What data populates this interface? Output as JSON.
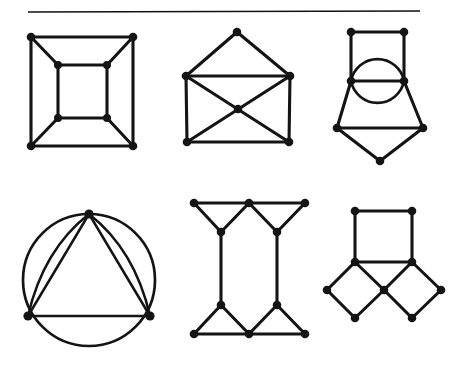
{
  "page": {
    "background_color": "#ffffff",
    "ink_color": "#141414",
    "width": 460,
    "height": 369
  },
  "rule": {
    "name": "horizontal-rule",
    "x1": 28,
    "y1": 12,
    "x2": 420,
    "y2": 11,
    "color": "#111111"
  },
  "figures": [
    {
      "id": "graph-1",
      "label": "nested-squares-cube-graph",
      "row": 1,
      "column": 1,
      "vertex_count": 8,
      "edge_count": 12,
      "vertices": [
        {
          "id": "o-tl",
          "x": 31,
          "y": 37
        },
        {
          "id": "o-tr",
          "x": 133,
          "y": 37
        },
        {
          "id": "o-br",
          "x": 133,
          "y": 146
        },
        {
          "id": "o-bl",
          "x": 31,
          "y": 146
        },
        {
          "id": "i-tl",
          "x": 58,
          "y": 65
        },
        {
          "id": "i-tr",
          "x": 107,
          "y": 65
        },
        {
          "id": "i-br",
          "x": 107,
          "y": 118
        },
        {
          "id": "i-bl",
          "x": 58,
          "y": 118
        }
      ],
      "edges": [
        [
          "o-tl",
          "o-tr"
        ],
        [
          "o-tr",
          "o-br"
        ],
        [
          "o-br",
          "o-bl"
        ],
        [
          "o-bl",
          "o-tl"
        ],
        [
          "i-tl",
          "i-tr"
        ],
        [
          "i-tr",
          "i-br"
        ],
        [
          "i-br",
          "i-bl"
        ],
        [
          "i-bl",
          "i-tl"
        ],
        [
          "o-tl",
          "i-tl"
        ],
        [
          "o-tr",
          "i-tr"
        ],
        [
          "o-br",
          "i-br"
        ],
        [
          "o-bl",
          "i-bl"
        ]
      ]
    },
    {
      "id": "graph-2",
      "label": "envelope-graph-with-crossing",
      "row": 1,
      "column": 2,
      "vertex_count": 6,
      "edge_count": 9,
      "vertices": [
        {
          "id": "apex",
          "x": 237,
          "y": 32
        },
        {
          "id": "left",
          "x": 186,
          "y": 76
        },
        {
          "id": "right",
          "x": 290,
          "y": 76
        },
        {
          "id": "center",
          "x": 238,
          "y": 109
        },
        {
          "id": "bl",
          "x": 187,
          "y": 142
        },
        {
          "id": "br",
          "x": 289,
          "y": 142
        }
      ],
      "edges": [
        [
          "apex",
          "left"
        ],
        [
          "apex",
          "right"
        ],
        [
          "left",
          "right"
        ],
        [
          "left",
          "bl"
        ],
        [
          "right",
          "br"
        ],
        [
          "bl",
          "br"
        ],
        [
          "left",
          "center"
        ],
        [
          "right",
          "center"
        ],
        [
          "center",
          "bl"
        ],
        [
          "center",
          "br"
        ]
      ]
    },
    {
      "id": "graph-3",
      "label": "square-circle-pentagon-graph",
      "row": 1,
      "column": 3,
      "vertex_count": 7,
      "edge_count": 10,
      "vertices": [
        {
          "id": "tl",
          "x": 351,
          "y": 32
        },
        {
          "id": "tr",
          "x": 404,
          "y": 32
        },
        {
          "id": "ml",
          "x": 351,
          "y": 81
        },
        {
          "id": "mr",
          "x": 404,
          "y": 81
        },
        {
          "id": "ll",
          "x": 337,
          "y": 128
        },
        {
          "id": "lr",
          "x": 423,
          "y": 128
        },
        {
          "id": "bottom",
          "x": 380,
          "y": 161
        }
      ],
      "edges": [
        [
          "tl",
          "tr"
        ],
        [
          "tl",
          "ml"
        ],
        [
          "tr",
          "mr"
        ],
        [
          "ml",
          "mr"
        ],
        [
          "ml",
          "ll"
        ],
        [
          "mr",
          "lr"
        ],
        [
          "ll",
          "lr"
        ],
        [
          "ll",
          "bottom"
        ],
        [
          "lr",
          "bottom"
        ]
      ],
      "arcs": [
        {
          "from": "ml",
          "to": "mr",
          "bulge": "up"
        },
        {
          "from": "ml",
          "to": "mr",
          "bulge": "down"
        }
      ]
    },
    {
      "id": "graph-4",
      "label": "circle-with-triangle-multi-edges",
      "row": 2,
      "column": 1,
      "vertex_count": 3,
      "edge_count": 6,
      "circle": {
        "cx": 89,
        "cy": 280,
        "r": 66
      },
      "vertices": [
        {
          "id": "top",
          "x": 89,
          "y": 214
        },
        {
          "id": "bl",
          "x": 28,
          "y": 316
        },
        {
          "id": "br",
          "x": 150,
          "y": 316
        }
      ],
      "edges": [
        [
          "top",
          "bl"
        ],
        [
          "top",
          "br"
        ],
        [
          "bl",
          "br"
        ]
      ],
      "arcs": [
        {
          "from": "top",
          "to": "bl",
          "bulge": "right"
        },
        {
          "from": "top",
          "to": "br",
          "bulge": "left"
        },
        {
          "from": "bl",
          "to": "br",
          "bulge": "down-outer"
        },
        {
          "from": "bl",
          "to": "top",
          "bulge": "left-outer"
        },
        {
          "from": "br",
          "to": "top",
          "bulge": "right-outer"
        }
      ]
    },
    {
      "id": "graph-5",
      "label": "h-shaped-double-triangle-graph",
      "row": 2,
      "column": 2,
      "vertex_count": 10,
      "edge_count": 14,
      "vertices": [
        {
          "id": "t-l",
          "x": 194,
          "y": 203
        },
        {
          "id": "t-m",
          "x": 249,
          "y": 203
        },
        {
          "id": "t-r",
          "x": 305,
          "y": 203
        },
        {
          "id": "ua-l",
          "x": 221,
          "y": 232
        },
        {
          "id": "ua-r",
          "x": 277,
          "y": 232
        },
        {
          "id": "la-l",
          "x": 221,
          "y": 305
        },
        {
          "id": "la-r",
          "x": 277,
          "y": 305
        },
        {
          "id": "b-l",
          "x": 194,
          "y": 334
        },
        {
          "id": "b-m",
          "x": 249,
          "y": 334
        },
        {
          "id": "b-r",
          "x": 305,
          "y": 334
        }
      ],
      "edges": [
        [
          "t-l",
          "t-m"
        ],
        [
          "t-m",
          "t-r"
        ],
        [
          "t-l",
          "ua-l"
        ],
        [
          "t-m",
          "ua-l"
        ],
        [
          "t-m",
          "ua-r"
        ],
        [
          "t-r",
          "ua-r"
        ],
        [
          "ua-l",
          "la-l"
        ],
        [
          "ua-r",
          "la-r"
        ],
        [
          "la-l",
          "b-l"
        ],
        [
          "la-l",
          "b-m"
        ],
        [
          "la-r",
          "b-m"
        ],
        [
          "la-r",
          "b-r"
        ],
        [
          "b-l",
          "b-m"
        ],
        [
          "b-m",
          "b-r"
        ]
      ]
    },
    {
      "id": "graph-6",
      "label": "square-with-two-diamonds-graph",
      "row": 2,
      "column": 3,
      "vertex_count": 8,
      "edge_count": 10,
      "vertices": [
        {
          "id": "sq-tl",
          "x": 355,
          "y": 211
        },
        {
          "id": "sq-tr",
          "x": 412,
          "y": 211
        },
        {
          "id": "sq-bl",
          "x": 355,
          "y": 262
        },
        {
          "id": "sq-br",
          "x": 412,
          "y": 262
        },
        {
          "id": "d-left",
          "x": 327,
          "y": 290
        },
        {
          "id": "d-center",
          "x": 384,
          "y": 290
        },
        {
          "id": "d-right",
          "x": 441,
          "y": 290
        },
        {
          "id": "d-bl",
          "x": 355,
          "y": 318
        },
        {
          "id": "d-br",
          "x": 412,
          "y": 318
        }
      ],
      "edges": [
        [
          "sq-tl",
          "sq-tr"
        ],
        [
          "sq-tl",
          "sq-bl"
        ],
        [
          "sq-tr",
          "sq-br"
        ],
        [
          "sq-bl",
          "sq-br"
        ],
        [
          "sq-bl",
          "d-left"
        ],
        [
          "d-left",
          "d-bl"
        ],
        [
          "d-bl",
          "d-center"
        ],
        [
          "d-center",
          "sq-bl"
        ],
        [
          "sq-br",
          "d-center"
        ],
        [
          "d-center",
          "d-br"
        ],
        [
          "d-br",
          "d-right"
        ],
        [
          "d-right",
          "sq-br"
        ]
      ]
    }
  ]
}
